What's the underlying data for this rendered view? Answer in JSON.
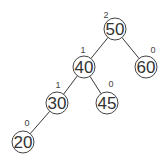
{
  "diagram": {
    "type": "binary-search-tree",
    "colors": {
      "background": "#ffffff",
      "edge": "#3a3a3a",
      "node_stroke": "#444444",
      "text": "#333333"
    },
    "nodes": [
      {
        "id": "n50",
        "value": "50",
        "balance": "2",
        "cx": 115,
        "cy": 29,
        "r": 11,
        "lx": 106,
        "ly": 15
      },
      {
        "id": "n40",
        "value": "40",
        "balance": "1",
        "cx": 84,
        "cy": 67,
        "r": 11,
        "lx": 83,
        "ly": 50
      },
      {
        "id": "n60",
        "value": "60",
        "balance": "0",
        "cx": 146,
        "cy": 67,
        "r": 11,
        "lx": 153,
        "ly": 50
      },
      {
        "id": "n30",
        "value": "30",
        "balance": "1",
        "cx": 57,
        "cy": 103,
        "r": 11,
        "lx": 58,
        "ly": 85
      },
      {
        "id": "n45",
        "value": "45",
        "balance": "0",
        "cx": 107,
        "cy": 103,
        "r": 11,
        "lx": 111,
        "ly": 84
      },
      {
        "id": "n20",
        "value": "20",
        "balance": "0",
        "cx": 23,
        "cy": 142,
        "r": 11,
        "lx": 27,
        "ly": 123
      }
    ],
    "edges": [
      {
        "from": "50",
        "to": "40"
      },
      {
        "from": "50",
        "to": "60"
      },
      {
        "from": "40",
        "to": "30"
      },
      {
        "from": "40",
        "to": "45"
      },
      {
        "from": "30",
        "to": "20"
      }
    ]
  }
}
